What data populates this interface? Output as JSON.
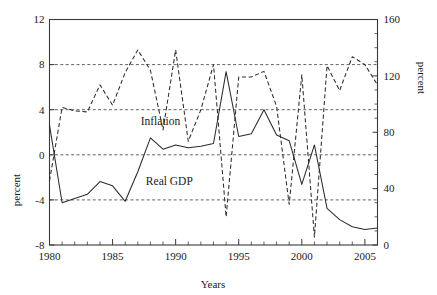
{
  "chart_data": {
    "type": "line",
    "title": "",
    "xlabel": "Years",
    "ylabel": "percent",
    "y2label": "percent",
    "grid": true,
    "legend_position": "inline-annotation",
    "xlim": [
      1980,
      2006
    ],
    "ylim": [
      -8,
      12
    ],
    "y2lim": [
      0,
      160
    ],
    "xticks": [
      1980,
      1985,
      1990,
      1995,
      2000,
      2005
    ],
    "xtick_labels": [
      "1980",
      "1985",
      "1990",
      "1995",
      "2000",
      "2005"
    ],
    "x_minor_tick_step": 1,
    "yticks": [
      -8,
      -4,
      0,
      4,
      8,
      12
    ],
    "ytick_labels": [
      "-8",
      "-4",
      "0",
      "4",
      "8",
      "12"
    ],
    "y2ticks": [
      0,
      40,
      80,
      120,
      160
    ],
    "y2tick_labels": [
      "0",
      "40",
      "80",
      "120",
      "160"
    ],
    "y2_minor_tick_step": 10,
    "gridlines_left_axis": [
      12,
      8,
      4,
      0,
      -4
    ],
    "x": [
      1980,
      1981,
      1982,
      1983,
      1984,
      1985,
      1986,
      1987,
      1988,
      1989,
      1990,
      1991,
      1992,
      1993,
      1994,
      1995,
      1996,
      1997,
      1998,
      1999,
      2000,
      2001,
      2002,
      2003,
      2004,
      2005,
      2006
    ],
    "series": [
      {
        "name": "Inflation",
        "axis": "right",
        "style": "solid",
        "label_text": "Inflation",
        "values": [
          85,
          30,
          33,
          36,
          45,
          42,
          31,
          52,
          76,
          68,
          71,
          69,
          70,
          72,
          123,
          77,
          79,
          96,
          78,
          74,
          43,
          71,
          26,
          18,
          13,
          11,
          12
        ]
      },
      {
        "name": "Real GDP",
        "axis": "left",
        "style": "dashed",
        "label_text": "Real GDP",
        "values": [
          -2.3,
          4.2,
          3.9,
          3.8,
          6.2,
          4.4,
          7.3,
          9.3,
          7.5,
          2.2,
          9.3,
          1.2,
          4.0,
          8.0,
          -5.5,
          6.9,
          6.9,
          7.4,
          4.3,
          -4.4,
          7.1,
          -7.3,
          7.9,
          5.7,
          8.7,
          8.0,
          6.2
        ]
      }
    ],
    "annotations": [
      {
        "text": "Inflation",
        "x": 1988.8,
        "y_right_axis": 85
      },
      {
        "text": "Real GDP",
        "x": 1989.5,
        "y_left_axis": -2.7
      }
    ]
  },
  "axes": {
    "left_title": "percent",
    "right_title": "percent",
    "x_title": "Years"
  },
  "colors": {
    "line": "#2b2b2b",
    "grid": "#3a3a3a",
    "frame": "#3a3a3a",
    "background": "#ffffff",
    "text": "#1a1a1a"
  }
}
